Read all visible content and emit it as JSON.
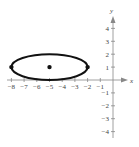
{
  "chart_data": {
    "type": "line",
    "title": "",
    "xlabel": "x",
    "ylabel": "y",
    "xlim": [
      -8.8,
      1.6
    ],
    "ylim": [
      -4.8,
      5.2
    ],
    "grid": false,
    "x_ticks": [
      -8,
      -7,
      -6,
      -5,
      -4,
      -3,
      -2,
      -1
    ],
    "x_tick_labels": [
      "−8",
      "−7",
      "−6",
      "−5",
      "−4",
      "−3",
      "−2",
      "−1"
    ],
    "y_ticks": [
      4,
      3,
      2,
      1,
      -1,
      -2,
      -3,
      -4
    ],
    "y_tick_labels": [
      "4",
      "3",
      "2",
      "1",
      "−1",
      "−2",
      "−3",
      "−4"
    ],
    "series": [
      {
        "name": "ellipse",
        "shape": "ellipse",
        "center": [
          -5,
          1
        ],
        "semi_major_x": 3,
        "semi_minor_y": 1
      }
    ],
    "points": [
      {
        "name": "center",
        "x": -5,
        "y": 1
      },
      {
        "name": "vertex-left",
        "x": -8,
        "y": 1
      },
      {
        "name": "vertex-right",
        "x": -2,
        "y": 1
      }
    ]
  },
  "axes": {
    "x_label": "x",
    "y_label": "y"
  }
}
